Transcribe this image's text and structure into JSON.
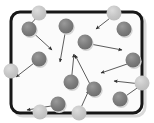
{
  "figure": {
    "title": "",
    "caption": "",
    "type": "kinetic-theory-gas-particle-diagram"
  },
  "colors": {
    "background": "#ffffff",
    "container_fill": "#fbfbfb",
    "container_border": "#171717",
    "particle_fill": "#7c7c7c",
    "particle_fill_light": "#b8b8b8",
    "wall_particle_fill": "#c9c9c9",
    "arrow_stroke": "#4a4a4a",
    "shadow": "#d6d6d6"
  },
  "container": {
    "label": "gas-container",
    "x": 11,
    "y": 12,
    "width": 131,
    "height": 101,
    "corner_radius": 9,
    "border_width": 3
  },
  "chart_data": {
    "type": "scatter",
    "xlabel": "",
    "ylabel": "",
    "xlim": [
      0,
      154
    ],
    "ylim": [
      0,
      123
    ],
    "grid": false,
    "legend": "none",
    "particle_radius": 7.5,
    "wall_particle_radius": 7.5,
    "particles": [
      {
        "id": "p1",
        "x": 29,
        "y": 29,
        "state": "interior"
      },
      {
        "id": "p2",
        "x": 66,
        "y": 26,
        "state": "interior"
      },
      {
        "id": "p3",
        "x": 124,
        "y": 29,
        "state": "interior"
      },
      {
        "id": "p4",
        "x": 85,
        "y": 42,
        "state": "interior"
      },
      {
        "id": "p5",
        "x": 39,
        "y": 59,
        "state": "interior"
      },
      {
        "id": "p6",
        "x": 133,
        "y": 60,
        "state": "interior"
      },
      {
        "id": "p7",
        "x": 71,
        "y": 82,
        "state": "interior"
      },
      {
        "id": "p8",
        "x": 94,
        "y": 89,
        "state": "interior"
      },
      {
        "id": "p9",
        "x": 120,
        "y": 99,
        "state": "interior"
      },
      {
        "id": "p10",
        "x": 58,
        "y": 104,
        "state": "interior"
      },
      {
        "id": "p11",
        "x": 39,
        "y": 13,
        "state": "wall-collision",
        "wall": "top"
      },
      {
        "id": "p12",
        "x": 114,
        "y": 13,
        "state": "wall-collision",
        "wall": "top"
      },
      {
        "id": "p13",
        "x": 11,
        "y": 71,
        "state": "wall-collision",
        "wall": "left"
      },
      {
        "id": "p14",
        "x": 142,
        "y": 83,
        "state": "wall-collision",
        "wall": "right"
      },
      {
        "id": "p15",
        "x": 40,
        "y": 112,
        "state": "wall-collision",
        "wall": "bottom"
      },
      {
        "id": "p16",
        "x": 79,
        "y": 113,
        "state": "wall-collision",
        "wall": "bottom"
      }
    ],
    "velocity_vectors": [
      {
        "id": "v1",
        "from": [
          29,
          29
        ],
        "to": [
          52,
          50
        ],
        "label": "down-right"
      },
      {
        "id": "v2",
        "from": [
          39,
          15
        ],
        "to": [
          28,
          27
        ],
        "label": "down-left"
      },
      {
        "id": "v3",
        "from": [
          66,
          28
        ],
        "to": [
          60,
          62
        ],
        "label": "down"
      },
      {
        "id": "v4",
        "from": [
          114,
          15
        ],
        "to": [
          96,
          29
        ],
        "label": "down-left"
      },
      {
        "id": "v5",
        "from": [
          85,
          43
        ],
        "to": [
          122,
          50
        ],
        "label": "right"
      },
      {
        "id": "v6",
        "from": [
          38,
          60
        ],
        "to": [
          16,
          77
        ],
        "label": "down-left"
      },
      {
        "id": "v7",
        "from": [
          133,
          62
        ],
        "to": [
          101,
          73
        ],
        "label": "left"
      },
      {
        "id": "v8",
        "from": [
          71,
          84
        ],
        "to": [
          74,
          54
        ],
        "label": "up"
      },
      {
        "id": "v9",
        "from": [
          141,
          84
        ],
        "to": [
          114,
          81
        ],
        "label": "left"
      },
      {
        "id": "v10",
        "from": [
          93,
          90
        ],
        "to": [
          75,
          55
        ],
        "label": "up-left"
      },
      {
        "id": "v11",
        "from": [
          57,
          105
        ],
        "to": [
          27,
          110
        ],
        "label": "left"
      },
      {
        "id": "v12",
        "from": [
          79,
          112
        ],
        "to": [
          89,
          90
        ],
        "label": "up-right"
      },
      {
        "id": "v13",
        "from": [
          120,
          100
        ],
        "to": [
          140,
          86
        ],
        "label": "up-right"
      }
    ]
  }
}
